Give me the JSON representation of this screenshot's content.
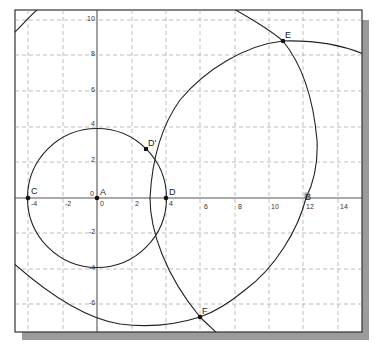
{
  "figure": {
    "type": "geometry-construction",
    "grid": "dashed",
    "x_ticks": [
      "-4",
      "-2",
      "0",
      "2",
      "4",
      "6",
      "8",
      "10",
      "12",
      "14"
    ],
    "y_ticks": [
      "10",
      "8",
      "6",
      "4",
      "2",
      "0",
      "-2",
      "-4",
      "-6"
    ],
    "origin_label": "0",
    "points": [
      {
        "name": "A",
        "x": 0,
        "y": 0
      },
      {
        "name": "C",
        "x": -4,
        "y": 0
      },
      {
        "name": "D",
        "x": 4,
        "y": 0
      },
      {
        "name": "D'",
        "x": 2.8,
        "y": 2.7
      },
      {
        "name": "E",
        "x": 10.8,
        "y": 8.8
      },
      {
        "name": "F",
        "x": 6.0,
        "y": -6.7
      },
      {
        "name": "B",
        "x": 12.0,
        "y": 0
      }
    ],
    "colors": {
      "curve": "#222222",
      "axis": "#444444",
      "grid": "#9a9a9a",
      "frame": "#333333",
      "shadow": "#9b9b9b"
    }
  },
  "labels": {
    "A": "A",
    "B": "B",
    "C": "C",
    "D": "D",
    "Dp": "D'",
    "E": "E",
    "F": "F",
    "x": {
      "m4": "-4",
      "m2": "-2",
      "z": "0",
      "p2": "2",
      "p4": "4",
      "p6": "6",
      "p8": "8",
      "p10": "10",
      "p12": "12",
      "p14": "14"
    },
    "y": {
      "p10": "10",
      "p8": "8",
      "p6": "6",
      "p4": "4",
      "p2": "2",
      "z": "0",
      "m2": "-2",
      "m4": "-4",
      "m6": "-6"
    }
  }
}
